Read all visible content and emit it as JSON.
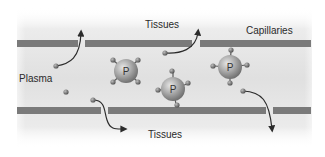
{
  "diagram": {
    "title": "",
    "labels": {
      "tissues_top": "Tissues",
      "capillaries": "Capillaries",
      "plasma": "Plasma",
      "tissues_bottom": "Tissues"
    },
    "protein_label": "P",
    "colors": {
      "background_gradient_light": "#f2f2f2",
      "background_gradient_dark": "#dcdcdc",
      "capillary_wall": "#7a7a7a",
      "protein_body": "#a8a8a8",
      "small_molecule": "#6e6e6e",
      "arrow": "#2b2b2b",
      "text": "#2a2a2a"
    },
    "elements": {
      "proteins_count": 3,
      "free_molecules_count": 2,
      "escaping_molecules_count": 4
    }
  }
}
